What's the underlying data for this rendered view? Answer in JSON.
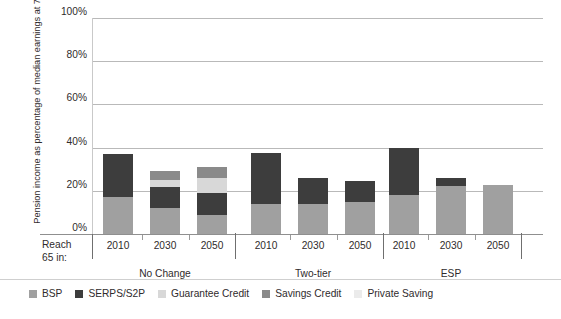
{
  "axis": {
    "y_title": "Pension income as percentage of median earnings at 75",
    "y_ticks": [
      "100%",
      "80%",
      "60%",
      "40%",
      "20%",
      "0%"
    ],
    "x_corner_label_line1": "Reach",
    "x_corner_label_line2": "65 in:"
  },
  "legend": {
    "items": [
      {
        "label": "BSP",
        "color": "#a0a0a0"
      },
      {
        "label": "SERPS/S2P",
        "color": "#3d3d3d"
      },
      {
        "label": "Guarantee Credit",
        "color": "#d8d8d8"
      },
      {
        "label": "Savings Credit",
        "color": "#8a8a8a"
      },
      {
        "label": "Private Saving",
        "color": "#ebebeb"
      }
    ]
  },
  "groups": [
    {
      "name": "No Change",
      "bars": [
        "2010",
        "2030",
        "2050"
      ]
    },
    {
      "name": "Two-tier",
      "bars": [
        "2010",
        "2030",
        "2050"
      ]
    },
    {
      "name": "ESP",
      "bars": [
        "2010",
        "2030",
        "2050"
      ]
    }
  ],
  "chart_data": {
    "type": "bar",
    "title": "",
    "subtitle": "",
    "stacked": true,
    "xlabel": "Reach 65 in:",
    "ylabel": "Pension income as percentage of median earnings at 75",
    "ylim": [
      0,
      100
    ],
    "yticks": [
      0,
      20,
      40,
      60,
      80,
      100
    ],
    "ytick_labels": [
      "0%",
      "20%",
      "40%",
      "60%",
      "80%",
      "100%"
    ],
    "grid": true,
    "legend_position": "bottom",
    "group_labels": [
      "No Change",
      "Two-tier",
      "ESP"
    ],
    "categories": [
      "No Change 2010",
      "No Change 2030",
      "No Change 2050",
      "Two-tier 2010",
      "Two-tier 2030",
      "Two-tier 2050",
      "ESP 2010",
      "ESP 2030",
      "ESP 2050"
    ],
    "series": [
      {
        "name": "BSP",
        "color": "#a0a0a0",
        "values": [
          17,
          12,
          9,
          14,
          14,
          15,
          18,
          22,
          22.5
        ]
      },
      {
        "name": "SERPS/S2P",
        "color": "#3d3d3d",
        "values": [
          20,
          10,
          10,
          23.5,
          12,
          9.5,
          22,
          4,
          0
        ]
      },
      {
        "name": "Guarantee Credit",
        "color": "#d8d8d8",
        "values": [
          0,
          3,
          7,
          0,
          0,
          0,
          0,
          0,
          0
        ]
      },
      {
        "name": "Savings Credit",
        "color": "#8a8a8a",
        "values": [
          0,
          4,
          5,
          0,
          0,
          0,
          0,
          0,
          0
        ]
      },
      {
        "name": "Private Saving",
        "color": "#ebebeb",
        "values": [
          0,
          0,
          0,
          0,
          0,
          0,
          0,
          0,
          0
        ]
      }
    ],
    "totals": [
      37,
      29,
      31,
      37.5,
      26,
      24.5,
      40,
      26,
      22.5
    ]
  }
}
